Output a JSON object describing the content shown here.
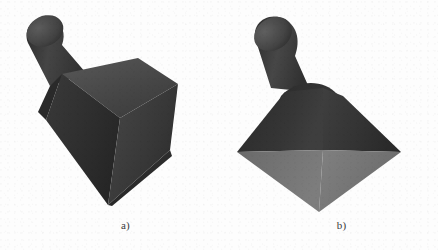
{
  "figure": {
    "background_color": "#fdfdfd",
    "subfigures": [
      {
        "id": "a",
        "caption": "a)",
        "object_name": "pyramid-with-cylindrical-knob",
        "view": "tilted",
        "description": "Square pyramid frustum seen from an oblique angle with a cylindrical knob projecting up and to the left from its top face",
        "faces": [
          {
            "name": "top-face",
            "fill": "#4a4a4a"
          },
          {
            "name": "left-face",
            "fill": "#323232"
          },
          {
            "name": "right-face",
            "fill": "#3d3d3d"
          },
          {
            "name": "front-lower-face",
            "fill": "#2b2b2b"
          },
          {
            "name": "knob-body",
            "fill": "#3c3c3c"
          },
          {
            "name": "knob-cap",
            "fill": "#4e4e4e"
          }
        ]
      },
      {
        "id": "b",
        "caption": "b)",
        "object_name": "pyramid-with-cylindrical-knob",
        "view": "upright-frontal",
        "description": "The same square pyramid seen upright from the front, light gray base face visible, cylindrical knob tilted to the left above the apex",
        "faces": [
          {
            "name": "left-face",
            "fill": "#333333"
          },
          {
            "name": "right-face",
            "fill": "#3a3a3a"
          },
          {
            "name": "base-left",
            "fill": "#6f6f6f"
          },
          {
            "name": "base-right",
            "fill": "#7c7c7c"
          },
          {
            "name": "knob-body",
            "fill": "#3b3b3b"
          },
          {
            "name": "knob-cap",
            "fill": "#545454"
          }
        ]
      }
    ]
  },
  "colors": {
    "page_background": "#ffffff",
    "panel_background": "#fdfdfd",
    "shape_dark": "#2b2b2b",
    "shape_mid": "#3d3d3d",
    "shape_light": "#7c7c7c",
    "caption_text": "#3a3a3a"
  }
}
